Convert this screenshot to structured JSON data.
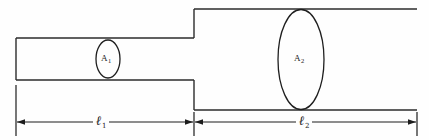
{
  "figure": {
    "kind": "stepped-pipe-cross-section-diagram",
    "background_color": "#fefefe",
    "line_color": "#2b2b2b"
  },
  "labels": {
    "area_small_symbol": "A",
    "area_small_sub": "1",
    "area_large_symbol": "A",
    "area_large_sub": "2",
    "length_small_symbol": "ℓ",
    "length_small_sub": "1",
    "length_large_symbol": "ℓ",
    "length_large_sub": "2"
  },
  "geometry": {
    "narrow_pipe": {
      "left_x": 16,
      "right_x": 194,
      "top_y": 38,
      "bottom_y": 80
    },
    "wide_pipe": {
      "left_x": 194,
      "right_x": 417,
      "top_y": 9,
      "bottom_y": 110
    },
    "ellipse_small": {
      "cx": 108,
      "cy": 59,
      "rx": 12,
      "ry": 19
    },
    "ellipse_large": {
      "cx": 301,
      "cy": 59.5,
      "rx": 23,
      "ry": 50
    },
    "dimension_line_y": 122,
    "extension_lines_x": [
      16,
      194,
      417
    ],
    "dim_segment_1": [
      16,
      194
    ],
    "dim_segment_2": [
      194,
      417
    ]
  }
}
